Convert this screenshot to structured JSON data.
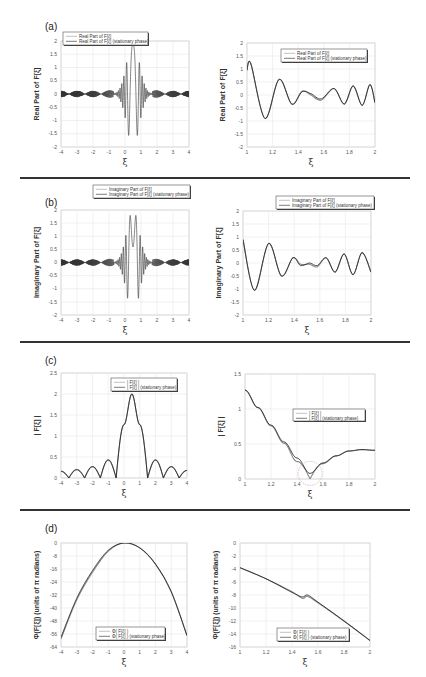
{
  "figure": {
    "panels": [
      {
        "label": "(a)"
      },
      {
        "label": "(b)"
      },
      {
        "label": "(c)"
      },
      {
        "label": "(d)"
      }
    ]
  },
  "chart_data": [
    {
      "id": "a-left",
      "type": "line",
      "panel": "(a)",
      "title": "",
      "xlabel": "ξ",
      "ylabel": "Real Part of F[ξ]",
      "xlim": [
        -4,
        4
      ],
      "ylim": [
        -2,
        2
      ],
      "xticks": [
        "-4",
        "-3",
        "-2",
        "-1",
        "0",
        "1",
        "2",
        "3",
        "4"
      ],
      "yticks": [
        "2",
        "1.5",
        "1",
        "0.5",
        "0",
        "-0.5",
        "-1",
        "-1.5",
        "-2"
      ],
      "grid": true,
      "legend_position": "top-left",
      "series": [
        {
          "name": "Real Part of F[ξ]",
          "description": "oscillatory chirp; small bursts amplitude ~0.1-0.4 for |ξ|>1, large swings near ξ≈0.5 reaching ~2 and ~-2"
        },
        {
          "name": "Real Part of F[ξ] (stationary phase)",
          "description": "overlaps exact curve"
        }
      ],
      "key_points": {
        "x": [
          -4,
          -3,
          -2,
          -1,
          -0.5,
          0,
          0.3,
          0.5,
          0.7,
          0.9,
          1,
          2,
          3,
          4
        ],
        "y": [
          0,
          0,
          0,
          0.3,
          0,
          0.6,
          1.9,
          -2,
          1.9,
          -1.5,
          0.6,
          0.3,
          0.1,
          0
        ]
      }
    },
    {
      "id": "a-right",
      "type": "line",
      "panel": "(a)",
      "xlabel": "ξ",
      "ylabel": "Real Part of F[ξ]",
      "xlim": [
        1,
        2
      ],
      "ylim": [
        -2,
        2
      ],
      "xticks": [
        "1",
        "1.2",
        "1.4",
        "1.6",
        "1.8",
        "2"
      ],
      "yticks": [
        "2",
        "1.5",
        "1",
        "0.5",
        "0",
        "-0.5",
        "-1",
        "-1.5",
        "-2"
      ],
      "grid": true,
      "legend_position": "top-right",
      "series": [
        {
          "name": "Real Part of F[ξ]",
          "x": [
            1.0,
            1.03,
            1.14,
            1.25,
            1.35,
            1.43,
            1.5,
            1.58,
            1.68,
            1.76,
            1.83,
            1.9,
            1.96,
            2.0
          ],
          "y": [
            0.95,
            1.2,
            -0.9,
            0.6,
            -0.35,
            0.15,
            0.0,
            -0.2,
            0.25,
            -0.35,
            0.35,
            -0.4,
            0.4,
            -0.3
          ]
        },
        {
          "name": "Real Part of F[ξ] (stationary phase)",
          "x": [
            1.0,
            1.03,
            1.14,
            1.25,
            1.35,
            1.43,
            1.5,
            1.58,
            1.68,
            1.76,
            1.83,
            1.9,
            1.96,
            2.0
          ],
          "y": [
            0.95,
            1.2,
            -0.9,
            0.6,
            -0.35,
            0.12,
            0.05,
            -0.15,
            0.25,
            -0.35,
            0.35,
            -0.4,
            0.4,
            -0.3
          ]
        }
      ]
    },
    {
      "id": "b-left",
      "type": "line",
      "panel": "(b)",
      "xlabel": "ξ",
      "ylabel": "Imaginary Part of F[ξ]",
      "xlim": [
        -4,
        4
      ],
      "ylim": [
        -2,
        2
      ],
      "xticks": [
        "-4",
        "-3",
        "-2",
        "-1",
        "0",
        "1",
        "2",
        "3",
        "4"
      ],
      "yticks": [
        "2",
        "1.5",
        "1",
        "0.5",
        "0",
        "-0.5",
        "-1",
        "-1.5",
        "-2"
      ],
      "grid": true,
      "legend_position": "top-right",
      "series": [
        {
          "name": "Imaginary Part of F[ξ]",
          "description": "oscillatory chirp; peak ~1.9 near ξ≈0.6, min ~-2 near ξ≈0.4"
        },
        {
          "name": "Imaginary Part of F[ξ] (stationary phase)",
          "description": "overlaps exact curve"
        }
      ],
      "key_points": {
        "x": [
          -4,
          -2,
          -1,
          0,
          0.2,
          0.4,
          0.6,
          0.8,
          1,
          2,
          4
        ],
        "y": [
          0,
          0,
          0.35,
          0.95,
          -0.5,
          -2,
          1.9,
          -1.2,
          0.8,
          0.35,
          0
        ]
      }
    },
    {
      "id": "b-right",
      "type": "line",
      "panel": "(b)",
      "xlabel": "ξ",
      "ylabel": "Imaginary Part of F[ξ]",
      "xlim": [
        1,
        2
      ],
      "ylim": [
        -2,
        2
      ],
      "xticks": [
        "1",
        "1.2",
        "1.4",
        "1.6",
        "1.8",
        "2"
      ],
      "yticks": [
        "2",
        "1.5",
        "1",
        "0.5",
        "0",
        "-0.5",
        "-1",
        "-1.5",
        "-2"
      ],
      "grid": true,
      "legend_position": "top-right",
      "series": [
        {
          "name": "Imaginary Part of F[ξ]",
          "x": [
            1.0,
            1.09,
            1.2,
            1.3,
            1.39,
            1.45,
            1.52,
            1.58,
            1.65,
            1.72,
            1.79,
            1.86,
            1.93,
            2.0
          ],
          "y": [
            0.9,
            -1.05,
            0.75,
            -0.5,
            0.2,
            -0.05,
            -0.05,
            -0.15,
            0.2,
            -0.35,
            0.35,
            -0.45,
            0.4,
            -0.35
          ]
        },
        {
          "name": "Imaginary Part of F[ξ] (stationary phase)",
          "x": [
            1.0,
            1.09,
            1.2,
            1.3,
            1.39,
            1.45,
            1.52,
            1.58,
            1.65,
            1.72,
            1.79,
            1.86,
            1.93,
            2.0
          ],
          "y": [
            0.9,
            -1.05,
            0.75,
            -0.5,
            0.2,
            -0.1,
            0.0,
            -0.1,
            0.2,
            -0.35,
            0.35,
            -0.45,
            0.4,
            -0.35
          ]
        }
      ]
    },
    {
      "id": "c-left",
      "type": "line",
      "panel": "(c)",
      "xlabel": "ξ",
      "ylabel": "| F[ξ] |",
      "xlim": [
        -4,
        4
      ],
      "ylim": [
        0,
        2.5
      ],
      "xticks": [
        "-4",
        "-3",
        "-2",
        "-1",
        "0",
        "1",
        "2",
        "3",
        "4"
      ],
      "yticks": [
        "2.5",
        "2",
        "1.5",
        "1",
        "0.5",
        "0"
      ],
      "grid": true,
      "legend_position": "top-right",
      "series": [
        {
          "name": "| F[ξ] |",
          "x": [
            -4,
            -3.5,
            -3,
            -2.5,
            -2,
            -1.5,
            -1,
            -0.5,
            0,
            0.5,
            1,
            1.5,
            2,
            2.5,
            3,
            3.5,
            4
          ],
          "y": [
            0.16,
            0,
            0.2,
            0,
            0.27,
            0,
            0.43,
            0,
            1.27,
            2.0,
            1.27,
            0,
            0.43,
            0,
            0.27,
            0,
            0.18
          ]
        },
        {
          "name": "| F[ξ] | (stationary phase)",
          "x": [
            -4,
            -3.5,
            -3,
            -2.5,
            -2,
            -1.5,
            -1,
            -0.5,
            0,
            0.5,
            1,
            1.5,
            2,
            2.5,
            3,
            3.5,
            4
          ],
          "y": [
            0.16,
            0,
            0.2,
            0,
            0.27,
            0,
            0.43,
            0,
            1.27,
            2.0,
            1.27,
            0,
            0.43,
            0,
            0.27,
            0,
            0.18
          ]
        }
      ]
    },
    {
      "id": "c-right",
      "type": "line",
      "panel": "(c)",
      "xlabel": "ξ",
      "ylabel": "| F[ξ] |",
      "xlim": [
        1,
        2
      ],
      "ylim": [
        0,
        1.5
      ],
      "xticks": [
        "1",
        "1.2",
        "1.4",
        "1.6",
        "1.8",
        "2"
      ],
      "yticks": [
        "1.5",
        "1",
        "0.5",
        "0"
      ],
      "grid": true,
      "legend_position": "center-right",
      "annotation": "dashed circle highlighting minimum near ξ=1.5",
      "series": [
        {
          "name": "| F[ξ] |",
          "x": [
            1.0,
            1.1,
            1.2,
            1.3,
            1.4,
            1.5,
            1.6,
            1.7,
            1.8,
            1.9,
            2.0
          ],
          "y": [
            1.27,
            1.02,
            0.76,
            0.51,
            0.25,
            0.0,
            0.22,
            0.33,
            0.4,
            0.42,
            0.41
          ]
        },
        {
          "name": "| F[ξ] | (stationary phase)",
          "x": [
            1.0,
            1.1,
            1.2,
            1.3,
            1.4,
            1.5,
            1.6,
            1.7,
            1.8,
            1.9,
            2.0
          ],
          "y": [
            1.27,
            1.02,
            0.77,
            0.53,
            0.3,
            0.08,
            0.23,
            0.33,
            0.4,
            0.42,
            0.41
          ]
        }
      ]
    },
    {
      "id": "d-left",
      "type": "line",
      "panel": "(d)",
      "xlabel": "ξ",
      "ylabel": "Φ(F[ξ]) (units of π radians)",
      "xlim": [
        -4,
        4
      ],
      "ylim": [
        -64,
        0
      ],
      "xticks": [
        "-4",
        "-3",
        "-2",
        "-1",
        "0",
        "1",
        "2",
        "3",
        "4"
      ],
      "yticks": [
        "0",
        "-8",
        "-16",
        "-24",
        "-32",
        "-40",
        "-48",
        "-56",
        "-64"
      ],
      "grid": true,
      "legend_position": "bottom-center",
      "series": [
        {
          "name": "Φ( F[ξ] )",
          "x": [
            -4,
            -3,
            -2,
            -1,
            0,
            1,
            2,
            3,
            4
          ],
          "y": [
            -59,
            -35,
            -18,
            -5,
            0,
            -3,
            -13,
            -30,
            -57
          ]
        },
        {
          "name": "Φ( F[ξ] ) (stationary phase)",
          "x": [
            -4,
            -3,
            -2,
            -1,
            0,
            1,
            2,
            3,
            4
          ],
          "y": [
            -58,
            -34,
            -17,
            -4.5,
            0,
            -3,
            -13,
            -30,
            -57
          ]
        }
      ]
    },
    {
      "id": "d-right",
      "type": "line",
      "panel": "(d)",
      "xlabel": "ξ",
      "ylabel": "Φ(F[ξ]) (units of π radians)",
      "xlim": [
        1,
        2
      ],
      "ylim": [
        -16,
        0
      ],
      "xticks": [
        "1",
        "1.2",
        "1.4",
        "1.6",
        "1.8",
        "2"
      ],
      "yticks": [
        "0",
        "-2",
        "-4",
        "-6",
        "-8",
        "-10",
        "-12",
        "-14",
        "-16"
      ],
      "grid": true,
      "legend_position": "bottom-center",
      "series": [
        {
          "name": "Φ( F[ξ] )",
          "x": [
            1.0,
            1.2,
            1.4,
            1.48,
            1.52,
            1.6,
            1.8,
            2.0
          ],
          "y": [
            -3.8,
            -5.5,
            -7.5,
            -8.5,
            -8.2,
            -9.2,
            -12,
            -15
          ]
        },
        {
          "name": "Φ( F[ξ] ) (stationary phase)",
          "x": [
            1.0,
            1.2,
            1.4,
            1.48,
            1.52,
            1.6,
            1.8,
            2.0
          ],
          "y": [
            -3.8,
            -5.5,
            -7.6,
            -8.3,
            -8.0,
            -9.1,
            -12,
            -15
          ]
        }
      ]
    }
  ]
}
